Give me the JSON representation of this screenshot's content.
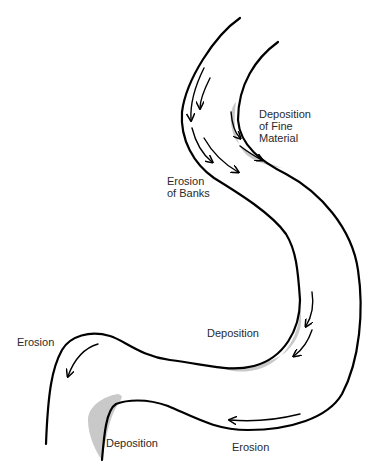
{
  "diagram": {
    "labels": {
      "deposition_fine": "Deposition\nof Fine\nMaterial",
      "erosion_banks": "Erosion\nof Banks",
      "deposition_middle": "Deposition",
      "erosion_left": "Erosion",
      "deposition_bottom": "Deposition",
      "erosion_bottom": "Erosion"
    },
    "colors": {
      "bank_line": "#000000",
      "deposit_fill": "#c9c9c9",
      "label_text": "#2a2a2a",
      "background": "#ffffff"
    }
  }
}
